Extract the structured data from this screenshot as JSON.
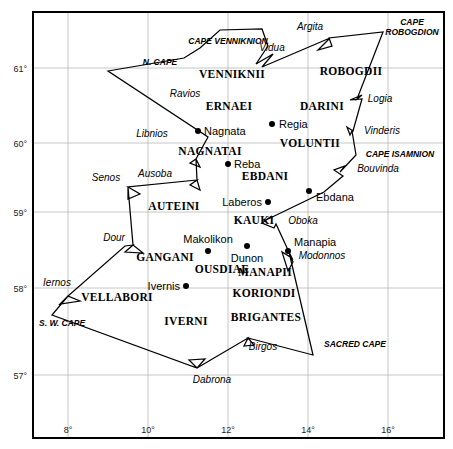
{
  "map": {
    "title": "Ptolemy's Map of Ireland",
    "colors": {
      "background": "#ffffff",
      "border": "#000000",
      "grid": "#b8b8b8",
      "coastline": "#000000",
      "city_dot": "#000000"
    },
    "frame": {
      "left": 33,
      "top": 12,
      "right": 444,
      "bottom": 438
    },
    "graticule": {
      "lat_ticks": [
        {
          "label": "61°",
          "y": 68
        },
        {
          "label": "60°",
          "y": 143
        },
        {
          "label": "59°",
          "y": 212
        },
        {
          "label": "58°",
          "y": 288
        },
        {
          "label": "57°",
          "y": 375
        }
      ],
      "lon_ticks": [
        {
          "label": "8°",
          "x": 68
        },
        {
          "label": "10°",
          "x": 148
        },
        {
          "label": "12°",
          "x": 228
        },
        {
          "label": "14°",
          "x": 308
        },
        {
          "label": "16°",
          "x": 388
        }
      ]
    },
    "coastline_path": "M 108,71 L 184,58 L 200,48 L 220,30 L 262,29 L 268,46 L 256,64 L 273,54 L 262,67 L 330,38 L 318,50 L 332,46 L 329,38 L 383,32 L 357,99 L 362,95 L 350,100 L 362,99 L 353,131 L 347,127 L 350,135 L 352,131 L 356,155 L 340,172 L 345,166 L 334,170 L 343,176 L 324,192 L 264,221 L 272,216 L 262,223 L 274,228 L 276,224 L 288,250 L 292,258 L 282,252 L 288,271 L 293,262 L 289,252 L 313,355 L 248,338 L 254,345 L 244,346 L 248,338 L 197,368 L 189,360 L 205,359 L 197,368 L 52,315 L 68,296 L 60,304 L 80,301 L 68,296 L 125,246 L 133,245 L 125,252 L 143,253 L 133,245 L 128,187 L 128,199 L 140,194 L 128,187 L 197,180 L 190,185 L 200,190 L 197,180 L 196,159 L 190,163 L 200,167 L 196,159 L 208,137 L 108,71 Z",
    "cities": [
      {
        "name": "Nagnata",
        "dot_x": 198,
        "dot_y": 131,
        "label_x": 204,
        "label_y": 135,
        "anchor": "start"
      },
      {
        "name": "Regia",
        "dot_x": 272,
        "dot_y": 124,
        "label_x": 279,
        "label_y": 128,
        "anchor": "start"
      },
      {
        "name": "Reba",
        "dot_x": 228,
        "dot_y": 164,
        "label_x": 234,
        "label_y": 168,
        "anchor": "start"
      },
      {
        "name": "Laberos",
        "dot_x": 268,
        "dot_y": 202,
        "label_x": 262,
        "label_y": 206,
        "anchor": "end"
      },
      {
        "name": "Ebdana",
        "dot_x": 309,
        "dot_y": 191,
        "label_x": 316,
        "label_y": 201,
        "anchor": "start"
      },
      {
        "name": "Makolikon",
        "dot_x": 208,
        "dot_y": 251,
        "label_x": 208,
        "label_y": 243,
        "anchor": "middle"
      },
      {
        "name": "Ivernis",
        "dot_x": 186,
        "dot_y": 286,
        "label_x": 180,
        "label_y": 290,
        "anchor": "end"
      },
      {
        "name": "Dunon",
        "dot_x": 247,
        "dot_y": 246,
        "label_x": 247,
        "label_y": 262,
        "anchor": "middle"
      },
      {
        "name": "Manapia",
        "dot_x": 288,
        "dot_y": 251,
        "label_x": 294,
        "label_y": 246,
        "anchor": "start"
      }
    ],
    "tribes": [
      {
        "name": "VENNIKNII",
        "x": 232,
        "y": 78,
        "anchor": "middle"
      },
      {
        "name": "ROBOGDII",
        "x": 351,
        "y": 75,
        "anchor": "middle"
      },
      {
        "name": "ERNAEI",
        "x": 229,
        "y": 110,
        "anchor": "middle"
      },
      {
        "name": "DARINI",
        "x": 322,
        "y": 110,
        "anchor": "middle"
      },
      {
        "name": "NAGNATAI",
        "x": 210,
        "y": 155,
        "anchor": "middle"
      },
      {
        "name": "VOLUNTII",
        "x": 310,
        "y": 147,
        "anchor": "middle"
      },
      {
        "name": "EBDANI",
        "x": 265,
        "y": 180,
        "anchor": "middle"
      },
      {
        "name": "AUTEINI",
        "x": 174,
        "y": 210,
        "anchor": "middle"
      },
      {
        "name": "KAUKI",
        "x": 254,
        "y": 224,
        "anchor": "middle"
      },
      {
        "name": "GANGANI",
        "x": 165,
        "y": 261,
        "anchor": "middle"
      },
      {
        "name": "OUSDIAE",
        "x": 222,
        "y": 273,
        "anchor": "middle"
      },
      {
        "name": "MANAPII",
        "x": 265,
        "y": 276,
        "anchor": "middle"
      },
      {
        "name": "KORIONDI",
        "x": 264,
        "y": 297,
        "anchor": "middle"
      },
      {
        "name": "VELLABORI",
        "x": 117,
        "y": 301,
        "anchor": "middle"
      },
      {
        "name": "IVERNI",
        "x": 186,
        "y": 325,
        "anchor": "middle"
      },
      {
        "name": "BRIGANTES",
        "x": 266,
        "y": 321,
        "anchor": "middle"
      }
    ],
    "rivers": [
      {
        "name": "Vidua",
        "x": 272,
        "y": 51,
        "anchor": "middle"
      },
      {
        "name": "Argita",
        "x": 310,
        "y": 30,
        "anchor": "middle"
      },
      {
        "name": "Ravios",
        "x": 185,
        "y": 97,
        "anchor": "middle"
      },
      {
        "name": "Logia",
        "x": 380,
        "y": 102,
        "anchor": "middle"
      },
      {
        "name": "Libnios",
        "x": 152,
        "y": 137,
        "anchor": "middle"
      },
      {
        "name": "Vinderis",
        "x": 382,
        "y": 134,
        "anchor": "middle"
      },
      {
        "name": "Senos",
        "x": 106,
        "y": 181,
        "anchor": "middle"
      },
      {
        "name": "Ausoba",
        "x": 155,
        "y": 177,
        "anchor": "middle"
      },
      {
        "name": "Bouvinda",
        "x": 378,
        "y": 172,
        "anchor": "middle"
      },
      {
        "name": "Oboka",
        "x": 303,
        "y": 224,
        "anchor": "middle"
      },
      {
        "name": "Dour",
        "x": 114,
        "y": 241,
        "anchor": "middle"
      },
      {
        "name": "Modonnos",
        "x": 322,
        "y": 259,
        "anchor": "middle"
      },
      {
        "name": "Iernos",
        "x": 57,
        "y": 286,
        "anchor": "middle"
      },
      {
        "name": "Birgos",
        "x": 263,
        "y": 350,
        "anchor": "middle"
      },
      {
        "name": "Dabrona",
        "x": 212,
        "y": 383,
        "anchor": "middle"
      }
    ],
    "capes": [
      {
        "name": "CAPE VENNIKNION",
        "x": 228,
        "y": 44,
        "anchor": "middle",
        "lines": [
          "CAPE VENNIKNION"
        ]
      },
      {
        "name": "CAPE ROBOGDION",
        "x": 412,
        "y": 25,
        "anchor": "middle",
        "lines": [
          "CAPE",
          "ROBOGDION"
        ]
      },
      {
        "name": "N. CAPE",
        "x": 160,
        "y": 65,
        "anchor": "middle",
        "lines": [
          "N. CAPE"
        ]
      },
      {
        "name": "CAPE ISAMNION",
        "x": 400,
        "y": 157,
        "anchor": "middle",
        "lines": [
          "CAPE ISAMNION"
        ]
      },
      {
        "name": "S. W. CAPE",
        "x": 39,
        "y": 326,
        "anchor": "start",
        "lines": [
          "S. W. CAPE"
        ]
      },
      {
        "name": "SACRED CAPE",
        "x": 355,
        "y": 347,
        "anchor": "middle",
        "lines": [
          "SACRED CAPE"
        ]
      }
    ]
  }
}
